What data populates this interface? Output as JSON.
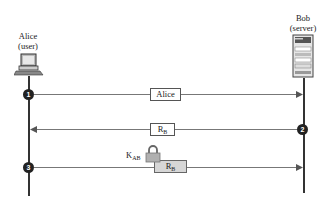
{
  "actors": {
    "alice": {
      "name": "Alice",
      "role": "(user)",
      "icon": "computer-icon"
    },
    "bob": {
      "name": "Bob",
      "role": "(server)",
      "icon": "server-icon"
    }
  },
  "messages": [
    {
      "step": "1",
      "direction": "alice-to-bob",
      "label": "Alice",
      "encrypted": false
    },
    {
      "step": "2",
      "direction": "bob-to-alice",
      "label_main": "R",
      "label_sub": "B",
      "encrypted": false
    },
    {
      "step": "3",
      "direction": "alice-to-bob",
      "label_main": "R",
      "label_sub": "B",
      "encrypted": true,
      "key_main": "K",
      "key_sub": "AB",
      "key_icon": "padlock-icon"
    }
  ],
  "colors": {
    "line": "#333333",
    "arrow": "#777777",
    "step_circle": "#222222",
    "encrypted_box": "#d6d6d6"
  }
}
